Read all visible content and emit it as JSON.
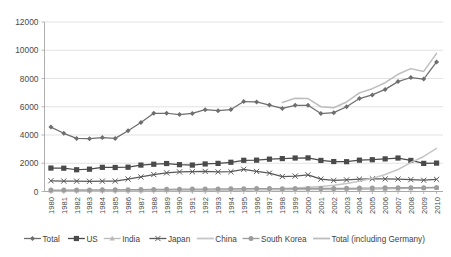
{
  "chart_data": {
    "type": "line",
    "title": "",
    "xlabel": "",
    "ylabel": "",
    "ylim": [
      0,
      12000
    ],
    "ytick_step": 2000,
    "yticks": [
      "0",
      "2000",
      "4000",
      "6000",
      "8000",
      "10000",
      "12000"
    ],
    "grid": true,
    "legend_position": "bottom",
    "x": [
      "1980",
      "1981",
      "1982",
      "1983",
      "1984",
      "1985",
      "1986",
      "1987",
      "1988",
      "1989",
      "1990",
      "1991",
      "1992",
      "1993",
      "1994",
      "1995",
      "1996",
      "1997",
      "1998",
      "1999",
      "2000",
      "2001",
      "2002",
      "2003",
      "2004",
      "2005",
      "2006",
      "2007",
      "2008",
      "2009",
      "2010"
    ],
    "series": [
      {
        "name": "Total",
        "color": "#6e6e6e",
        "marker": "diamond",
        "values": [
          4560,
          4120,
          3760,
          3740,
          3820,
          3760,
          4300,
          4880,
          5540,
          5540,
          5450,
          5530,
          5790,
          5720,
          5800,
          6370,
          6340,
          6120,
          5880,
          6100,
          6100,
          5520,
          5580,
          6000,
          6580,
          6840,
          7230,
          7780,
          8070,
          7960,
          9170
        ]
      },
      {
        "name": "US",
        "color": "#4a4a4a",
        "marker": "square",
        "values": [
          1660,
          1650,
          1540,
          1580,
          1710,
          1700,
          1720,
          1870,
          1930,
          1980,
          1900,
          1870,
          1950,
          1990,
          2070,
          2210,
          2220,
          2290,
          2330,
          2370,
          2380,
          2200,
          2120,
          2110,
          2220,
          2250,
          2310,
          2370,
          2200,
          1990,
          2010
        ]
      },
      {
        "name": "India",
        "color": "#b9b9b9",
        "marker": "triangle",
        "values": [
          60,
          62,
          65,
          68,
          70,
          72,
          75,
          78,
          82,
          85,
          88,
          90,
          93,
          96,
          100,
          105,
          110,
          115,
          120,
          125,
          130,
          135,
          140,
          148,
          158,
          170,
          185,
          200,
          215,
          235,
          255
        ]
      },
      {
        "name": "Japan",
        "color": "#595959",
        "marker": "cross",
        "values": [
          760,
          740,
          730,
          720,
          730,
          740,
          880,
          1030,
          1200,
          1320,
          1390,
          1400,
          1420,
          1390,
          1400,
          1570,
          1420,
          1300,
          1060,
          1090,
          1180,
          880,
          780,
          820,
          870,
          900,
          890,
          880,
          840,
          800,
          860
        ]
      },
      {
        "name": "China",
        "color": "#c6c6c6",
        "marker": "none",
        "values": [
          25,
          28,
          32,
          36,
          40,
          45,
          50,
          56,
          62,
          68,
          75,
          82,
          92,
          105,
          120,
          140,
          160,
          185,
          215,
          250,
          300,
          360,
          440,
          560,
          720,
          930,
          1200,
          1560,
          2050,
          2480,
          3050
        ]
      },
      {
        "name": "South Korea",
        "color": "#9d9d9d",
        "marker": "circle",
        "values": [
          100,
          105,
          108,
          112,
          118,
          122,
          130,
          140,
          150,
          158,
          165,
          170,
          175,
          180,
          188,
          200,
          208,
          210,
          195,
          205,
          218,
          215,
          220,
          228,
          240,
          248,
          258,
          268,
          272,
          268,
          290
        ]
      },
      {
        "name": "Total (including Germany)",
        "color": "#bdbdbd",
        "marker": "none",
        "values": [
          null,
          null,
          null,
          null,
          null,
          null,
          null,
          null,
          null,
          null,
          null,
          null,
          null,
          null,
          null,
          null,
          null,
          null,
          6300,
          6600,
          6580,
          6000,
          5930,
          6340,
          6980,
          7280,
          7700,
          8300,
          8700,
          8500,
          9780
        ]
      }
    ]
  },
  "legend": {
    "items": [
      {
        "label": "Total"
      },
      {
        "label": "US"
      },
      {
        "label": "India"
      },
      {
        "label": "Japan"
      },
      {
        "label": "China"
      },
      {
        "label": "South Korea"
      },
      {
        "label": "Total (including Germany)"
      }
    ]
  }
}
